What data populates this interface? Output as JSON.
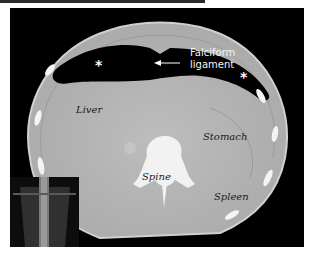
{
  "image": {
    "description": "Axial CT scan of the upper abdomen showing free air (pneumoperitoneum) outlining the falciform ligament",
    "labels": {
      "falciform": "Falciform",
      "ligament": "ligament",
      "liver": "Liver",
      "stomach": "Stomach",
      "spine": "Spine",
      "spleen": "Spleen"
    },
    "markers": {
      "asterisk": "*"
    },
    "colors": {
      "background": "#000000",
      "soft_tissue": "#b4b4b4",
      "bone": "#f2f2f2",
      "air": "#000000",
      "annotation_text": "#1a1a1a",
      "annotation_text_light": "#f4f4f4"
    }
  }
}
